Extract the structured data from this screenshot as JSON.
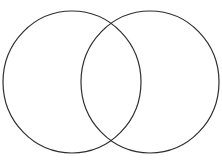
{
  "diagram": {
    "type": "venn",
    "canvas": {
      "width": 222,
      "height": 166,
      "background_color": "#ffffff"
    },
    "style": {
      "stroke_color": "#2e2e2e",
      "stroke_width": 1.2,
      "fill": "none"
    },
    "shapes": [
      {
        "id": "left-circle",
        "label": "",
        "cx": 72,
        "cy": 82,
        "rx": 69,
        "ry": 71
      },
      {
        "id": "right-circle",
        "label": "",
        "cx": 150,
        "cy": 82,
        "rx": 69,
        "ry": 71
      }
    ],
    "intersection_points": [
      {
        "x": 112,
        "y": 27
      },
      {
        "x": 112,
        "y": 137
      }
    ],
    "regions": [
      {
        "id": "left-only",
        "label": ""
      },
      {
        "id": "intersection",
        "label": ""
      },
      {
        "id": "right-only",
        "label": ""
      }
    ]
  }
}
